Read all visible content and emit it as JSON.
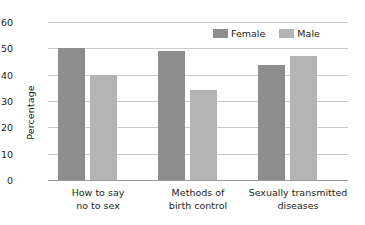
{
  "chart_data": {
    "type": "bar",
    "title": "",
    "subtitle": "",
    "xlabel": "",
    "ylabel": "Percentage",
    "ylim": [
      0,
      60
    ],
    "yticks": [
      0,
      10,
      20,
      30,
      40,
      50,
      60
    ],
    "ytick_labels": [
      "0",
      "10",
      "20",
      "30",
      "40",
      "50",
      "60"
    ],
    "grid": true,
    "legend_position": "top-right",
    "categories": [
      "How to say no to sex",
      "Methods of birth control",
      "Sexually transmitted diseases"
    ],
    "category_lines": [
      [
        "How to say",
        "no to sex"
      ],
      [
        "Methods of",
        "birth control"
      ],
      [
        "Sexually transmitted",
        "diseases"
      ]
    ],
    "series": [
      {
        "name": "Female",
        "color": "#8d8d8d",
        "values": [
          50,
          49,
          43.5
        ]
      },
      {
        "name": "Male",
        "color": "#b4b4b4",
        "values": [
          40,
          34,
          47
        ]
      }
    ]
  },
  "legend": {
    "items": [
      {
        "label": "Female",
        "color": "#8d8d8d"
      },
      {
        "label": "Male",
        "color": "#b4b4b4"
      }
    ]
  },
  "axis": {
    "y_title": "Percentage"
  },
  "colors": {
    "female_bar": "#8d8d8d",
    "male_bar": "#b4b4b4",
    "gridline": "#c9c9c9",
    "baseline": "#9a9a9a",
    "text": "#231f20",
    "background": "#ffffff"
  }
}
